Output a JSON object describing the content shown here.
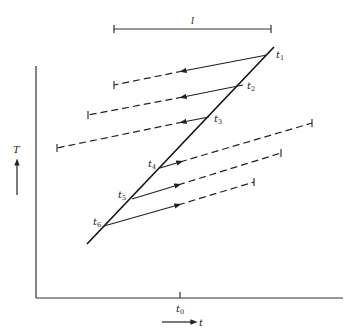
{
  "diagram": {
    "y_axis_label": "T",
    "x_axis_label": "t",
    "x_tick_label": "t",
    "x_tick_sub": "0",
    "interval_label": "l",
    "points": [
      {
        "label": "t",
        "sub": "1"
      },
      {
        "label": "t",
        "sub": "2"
      },
      {
        "label": "t",
        "sub": "3"
      },
      {
        "label": "t",
        "sub": "4"
      },
      {
        "label": "t",
        "sub": "5"
      },
      {
        "label": "t",
        "sub": "6"
      }
    ]
  }
}
